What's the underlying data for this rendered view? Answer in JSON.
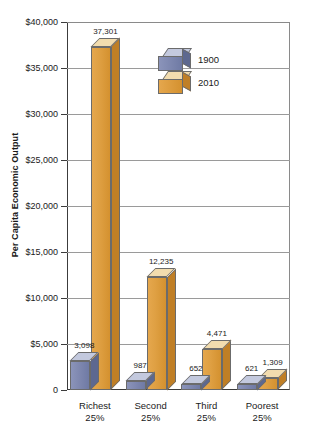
{
  "chart_data": {
    "type": "bar",
    "title": "",
    "xlabel": "",
    "ylabel": "Per Capita Economic Output",
    "categories": [
      "Richest 25%",
      "Second 25%",
      "Third 25%",
      "Poorest 25%"
    ],
    "category_lines": [
      {
        "top": "Richest",
        "bottom": "25%"
      },
      {
        "top": "Second",
        "bottom": "25%"
      },
      {
        "top": "Third",
        "bottom": "25%"
      },
      {
        "top": "Poorest",
        "bottom": "25%"
      }
    ],
    "series": [
      {
        "name": "1900",
        "color": "#7f88b0",
        "values": [
          3098,
          987,
          652,
          621
        ],
        "labels": [
          "3,098",
          "987",
          "652",
          "621"
        ]
      },
      {
        "name": "2010",
        "color": "#dfa043",
        "values": [
          37301,
          12235,
          4471,
          1309
        ],
        "labels": [
          "37,301",
          "12,235",
          "4,471",
          "1,309"
        ]
      }
    ],
    "ylim": [
      0,
      40000
    ],
    "ytick_values": [
      0,
      5000,
      10000,
      15000,
      20000,
      25000,
      30000,
      35000,
      40000
    ],
    "ytick_labels": [
      "0",
      "$5,000",
      "$10,000",
      "$15,000",
      "$20,000",
      "$25,000",
      "$30,000",
      "$35,000",
      "$40,000"
    ],
    "grid": true,
    "legend_position": "inside-upper-center",
    "legend_entries": [
      "1900",
      "2010"
    ]
  }
}
